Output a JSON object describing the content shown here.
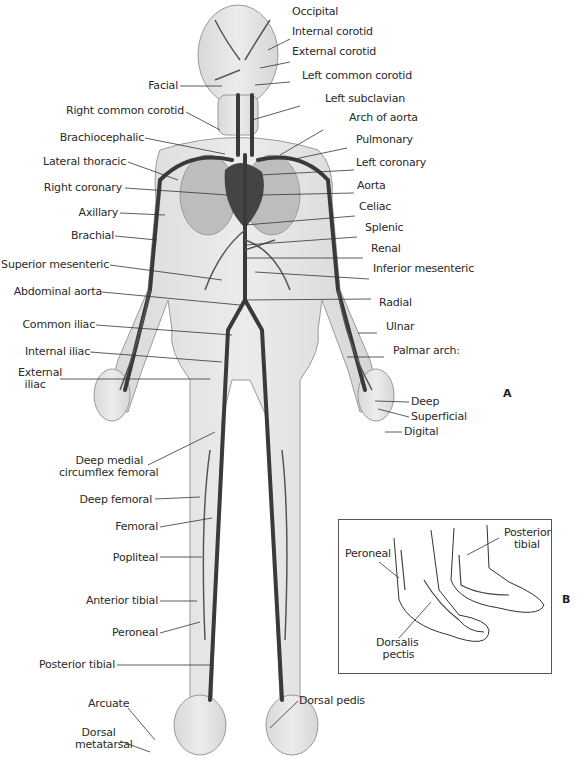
{
  "figure": {
    "panels": [
      {
        "id": "A",
        "label": "A"
      },
      {
        "id": "B",
        "label": "B"
      }
    ]
  },
  "panel_a": {
    "labels_right": [
      {
        "text": "Occipital",
        "x": 292,
        "y": 6
      },
      {
        "text": "Internal corotid",
        "x": 292,
        "y": 26
      },
      {
        "text": "External corotid",
        "x": 292,
        "y": 46
      },
      {
        "text": "Left common corotid",
        "x": 302,
        "y": 70
      },
      {
        "text": "Left subclavian",
        "x": 325,
        "y": 93
      },
      {
        "text": "Arch of aorta",
        "x": 349,
        "y": 112
      },
      {
        "text": "Pulmonary",
        "x": 356,
        "y": 134
      },
      {
        "text": "Left coronary",
        "x": 356,
        "y": 157
      },
      {
        "text": "Aorta",
        "x": 357,
        "y": 180
      },
      {
        "text": "Celiac",
        "x": 359,
        "y": 201
      },
      {
        "text": "Splenic",
        "x": 365,
        "y": 222
      },
      {
        "text": "Renal",
        "x": 371,
        "y": 243
      },
      {
        "text": "Inferior mesenteric",
        "x": 373,
        "y": 263
      },
      {
        "text": "Radial",
        "x": 379,
        "y": 297
      },
      {
        "text": "Ulnar",
        "x": 386,
        "y": 321
      },
      {
        "text": "Palmar arch:",
        "x": 393,
        "y": 348
      },
      {
        "text": "Deep",
        "x": 411,
        "y": 366
      },
      {
        "text": "Superficial",
        "x": 411,
        "y": 381
      },
      {
        "text": "Digital",
        "x": 404,
        "y": 396
      }
    ],
    "labels_left": [
      {
        "text": "Facial",
        "right": 440,
        "y": 80
      },
      {
        "text": "Right common corotid",
        "right": 400,
        "y": 105
      },
      {
        "text": "Brachiocephalic",
        "right": 440,
        "y": 130
      },
      {
        "text": "Lateral thoracic",
        "right": 458,
        "y": 154
      },
      {
        "text": "Right coronary",
        "right": 462,
        "y": 181
      },
      {
        "text": "Axillary",
        "right": 466,
        "y": 206
      },
      {
        "text": "Brachial",
        "right": 470,
        "y": 229
      },
      {
        "text": "Superior mesenteric",
        "right": 475,
        "y": 258
      },
      {
        "text": "Abdominal aorta",
        "right": 482,
        "y": 285
      },
      {
        "text": "Common iliac",
        "right": 489,
        "y": 318
      },
      {
        "text": "Internal iliac",
        "right": 494,
        "y": 345
      },
      {
        "text": "Deep femoral",
        "right": 432,
        "y": 494
      },
      {
        "text": "Femoral",
        "right": 426,
        "y": 521
      },
      {
        "text": "Popliteal",
        "right": 426,
        "y": 553
      },
      {
        "text": "Anterior tibial",
        "right": 426,
        "y": 595
      },
      {
        "text": "Peroneal",
        "right": 426,
        "y": 627
      },
      {
        "text": "Posterior tibial",
        "right": 469,
        "y": 659
      },
      {
        "text": "Dorsal pedis",
        "x": 299,
        "y": 695
      }
    ],
    "labels_multiline": [
      {
        "text": "External\n  iliac",
        "x": 18,
        "y": 367
      },
      {
        "text": "     Deep medial\ncircumflex femoral",
        "x": 59,
        "y": 455
      },
      {
        "text": "Arcuate",
        "x": 88,
        "y": 698
      },
      {
        "text": "  Dorsal\nmetatarsal",
        "x": 75,
        "y": 727
      }
    ]
  },
  "panel_b": {
    "labels": [
      {
        "text": "Peroneal",
        "x": 344,
        "y": 548
      },
      {
        "text": "Posterior\n   tibial",
        "x": 503,
        "y": 527
      },
      {
        "text": "Dorsalis\n  pectis",
        "x": 375,
        "y": 637
      }
    ]
  }
}
